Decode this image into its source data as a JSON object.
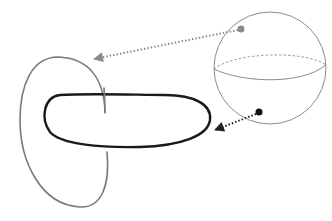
{
  "diagram": {
    "colors": {
      "background": "#ffffff",
      "gray_loop": "#7a7a7a",
      "black_loop": "#1a1a1a",
      "sphere_outline": "#8c8c8c",
      "gray_arrow": "#8a8a8a",
      "black_arrow": "#222222",
      "gray_dot": "#8a8a8a",
      "black_dot": "#111111"
    },
    "elements": [
      {
        "id": "gray-loop",
        "type": "closed-curve",
        "stroke": "gray"
      },
      {
        "id": "black-loop",
        "type": "closed-curve",
        "stroke": "black"
      },
      {
        "id": "sphere",
        "type": "sphere",
        "center": [
          270,
          68
        ],
        "radius": 56,
        "equator": "dashed-back, solid-front"
      },
      {
        "id": "gray-point",
        "type": "point",
        "position": [
          241,
          29
        ],
        "color": "gray"
      },
      {
        "id": "black-point",
        "type": "point",
        "position": [
          259,
          112
        ],
        "color": "black"
      },
      {
        "id": "gray-arrow",
        "type": "dotted-arrow",
        "from": [
          241,
          29
        ],
        "to": [
          92,
          59
        ]
      },
      {
        "id": "black-arrow",
        "type": "dotted-arrow",
        "from": [
          259,
          112
        ],
        "to": [
          213,
          131
        ]
      }
    ]
  }
}
